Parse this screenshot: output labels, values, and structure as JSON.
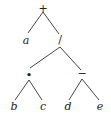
{
  "diagram": {
    "type": "expression-tree",
    "nodes": {
      "root": {
        "label": "+",
        "x": 43,
        "y": 10
      },
      "a": {
        "label": "a",
        "x": 26,
        "y": 44
      },
      "div": {
        "label": "/",
        "x": 60,
        "y": 40
      },
      "mul": {
        "label": "•",
        "x": 29,
        "y": 76
      },
      "sub": {
        "label": "−",
        "x": 82,
        "y": 76
      },
      "b": {
        "label": "b",
        "x": 14,
        "y": 110
      },
      "c": {
        "label": "c",
        "x": 43,
        "y": 110
      },
      "d": {
        "label": "d",
        "x": 68,
        "y": 110
      },
      "e": {
        "label": "e",
        "x": 100,
        "y": 110
      }
    },
    "edges": [
      [
        "root",
        "a"
      ],
      [
        "root",
        "div"
      ],
      [
        "div",
        "mul"
      ],
      [
        "div",
        "sub"
      ],
      [
        "mul",
        "b"
      ],
      [
        "mul",
        "c"
      ],
      [
        "sub",
        "d"
      ],
      [
        "sub",
        "e"
      ]
    ]
  }
}
